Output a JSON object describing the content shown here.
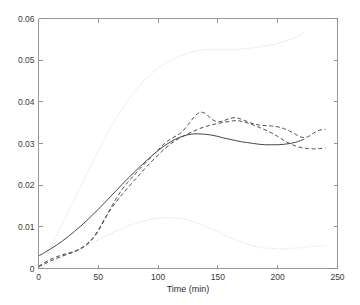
{
  "chart_data": {
    "type": "line",
    "title": "",
    "subtitle": "",
    "xlabel": "Time (min)",
    "ylabel": "",
    "xlim": [
      0,
      250
    ],
    "ylim": [
      0,
      0.06
    ],
    "xticks": [
      0,
      50,
      100,
      150,
      200,
      250
    ],
    "yticks": [
      0,
      0.01,
      0.02,
      0.03,
      0.04,
      0.05,
      0.06
    ],
    "xtick_labels": [
      "0",
      "50",
      "100",
      "150",
      "200",
      "250"
    ],
    "ytick_labels": [
      "0",
      "0.01",
      "0.02",
      "0.03",
      "0.04",
      "0.05",
      "0.06"
    ],
    "grid": false,
    "legend": null,
    "legend_position": "none",
    "annotations": [],
    "colors": {
      "solid": "#474747",
      "dashed": "#4e4e4e",
      "dotted": "#dedede",
      "axis": "#8c8c8c",
      "background": "#ffffff",
      "text": "#3a3a3a"
    },
    "series": [
      {
        "name": "mean-estimate",
        "style": "solid",
        "color": "#474747",
        "x": [
          0,
          5,
          10,
          15,
          20,
          25,
          30,
          35,
          40,
          45,
          50,
          55,
          60,
          65,
          70,
          75,
          80,
          85,
          90,
          95,
          100,
          105,
          110,
          115,
          120,
          125,
          130,
          135,
          140,
          145,
          150,
          155,
          160,
          165,
          170,
          175,
          180,
          185,
          190,
          195,
          200,
          205,
          210,
          215,
          220,
          222
        ],
        "y": [
          0.003,
          0.0038,
          0.0047,
          0.0056,
          0.0066,
          0.0077,
          0.0089,
          0.0101,
          0.0114,
          0.0128,
          0.0142,
          0.0157,
          0.0172,
          0.0187,
          0.0202,
          0.0217,
          0.0231,
          0.0245,
          0.0258,
          0.0271,
          0.0283,
          0.0294,
          0.0303,
          0.0311,
          0.0317,
          0.0321,
          0.0323,
          0.0323,
          0.0322,
          0.032,
          0.0317,
          0.0313,
          0.031,
          0.0307,
          0.0304,
          0.0302,
          0.03,
          0.0298,
          0.0297,
          0.0297,
          0.0297,
          0.0298,
          0.03,
          0.0303,
          0.0308,
          0.031
        ]
      },
      {
        "name": "replicate-upper-dashed",
        "style": "dashed",
        "color": "#4e4e4e",
        "x": [
          0,
          5,
          10,
          15,
          20,
          25,
          30,
          35,
          40,
          45,
          50,
          55,
          60,
          65,
          70,
          75,
          80,
          85,
          90,
          95,
          100,
          105,
          110,
          115,
          120,
          125,
          130,
          135,
          140,
          145,
          150,
          155,
          160,
          165,
          170,
          175,
          180,
          185,
          190,
          195,
          200,
          205,
          210,
          215,
          220,
          225,
          230,
          235,
          240
        ],
        "y": [
          0.0004,
          0.0011,
          0.0018,
          0.0024,
          0.003,
          0.0035,
          0.004,
          0.0047,
          0.0056,
          0.007,
          0.009,
          0.0116,
          0.0143,
          0.0168,
          0.019,
          0.0208,
          0.0224,
          0.024,
          0.0255,
          0.027,
          0.0285,
          0.0299,
          0.031,
          0.0318,
          0.0328,
          0.0345,
          0.0363,
          0.0375,
          0.0371,
          0.0358,
          0.0352,
          0.0355,
          0.036,
          0.0362,
          0.0358,
          0.0352,
          0.0347,
          0.0344,
          0.0343,
          0.0342,
          0.034,
          0.0336,
          0.033,
          0.0322,
          0.0315,
          0.0316,
          0.0325,
          0.0332,
          0.0334
        ]
      },
      {
        "name": "replicate-lower-dashed",
        "style": "dashed",
        "color": "#4e4e4e",
        "x": [
          0,
          5,
          10,
          15,
          20,
          25,
          30,
          35,
          40,
          45,
          50,
          55,
          60,
          65,
          70,
          75,
          80,
          85,
          90,
          95,
          100,
          105,
          110,
          115,
          120,
          125,
          130,
          135,
          140,
          145,
          150,
          155,
          160,
          165,
          170,
          175,
          180,
          185,
          190,
          195,
          200,
          205,
          210,
          215,
          220,
          225,
          230,
          235,
          240
        ],
        "y": [
          0.0005,
          0.0014,
          0.0022,
          0.0028,
          0.0033,
          0.0037,
          0.0041,
          0.0048,
          0.0058,
          0.0072,
          0.0092,
          0.0118,
          0.014,
          0.016,
          0.0178,
          0.0195,
          0.0211,
          0.0227,
          0.0243,
          0.0258,
          0.0272,
          0.0286,
          0.0298,
          0.0308,
          0.0316,
          0.0323,
          0.033,
          0.0336,
          0.0341,
          0.0345,
          0.0348,
          0.0351,
          0.0353,
          0.0355,
          0.0353,
          0.0349,
          0.0344,
          0.0338,
          0.0332,
          0.0325,
          0.0317,
          0.0308,
          0.03,
          0.0294,
          0.029,
          0.0288,
          0.0287,
          0.0288,
          0.0289
        ]
      },
      {
        "name": "confidence-upper-envelope",
        "style": "dotted",
        "color": "#dedede",
        "x": [
          0,
          5,
          10,
          15,
          20,
          25,
          30,
          35,
          40,
          45,
          50,
          55,
          60,
          65,
          70,
          75,
          80,
          85,
          90,
          95,
          100,
          105,
          110,
          115,
          120,
          125,
          130,
          135,
          140,
          145,
          150,
          155,
          160,
          165,
          170,
          175,
          180,
          185,
          190,
          195,
          200,
          205,
          210,
          215,
          220,
          222
        ],
        "y": [
          0.0,
          0.0025,
          0.0052,
          0.008,
          0.0108,
          0.0137,
          0.0166,
          0.0196,
          0.0225,
          0.0254,
          0.0282,
          0.031,
          0.0336,
          0.036,
          0.0383,
          0.0404,
          0.0423,
          0.044,
          0.0456,
          0.0469,
          0.0481,
          0.0491,
          0.0499,
          0.0506,
          0.0512,
          0.0517,
          0.0521,
          0.0523,
          0.0525,
          0.0526,
          0.0526,
          0.0526,
          0.0526,
          0.0526,
          0.0527,
          0.0528,
          0.053,
          0.0532,
          0.0534,
          0.0537,
          0.054,
          0.0544,
          0.0549,
          0.0555,
          0.0563,
          0.0567
        ]
      },
      {
        "name": "confidence-lower-envelope",
        "style": "dotted",
        "color": "#dedede",
        "x": [
          0,
          5,
          10,
          15,
          20,
          25,
          30,
          35,
          40,
          45,
          50,
          55,
          60,
          65,
          70,
          75,
          80,
          85,
          90,
          95,
          100,
          105,
          110,
          115,
          120,
          125,
          130,
          135,
          140,
          145,
          150,
          155,
          160,
          165,
          170,
          175,
          180,
          185,
          190,
          195,
          200,
          205,
          210,
          215,
          220,
          225,
          230,
          235,
          240
        ],
        "y": [
          0.0,
          0.0006,
          0.0013,
          0.002,
          0.0027,
          0.0034,
          0.0041,
          0.0048,
          0.0055,
          0.0062,
          0.0069,
          0.0076,
          0.0083,
          0.009,
          0.0096,
          0.0102,
          0.0107,
          0.0112,
          0.0116,
          0.0119,
          0.0121,
          0.0122,
          0.0122,
          0.0121,
          0.0119,
          0.0116,
          0.0112,
          0.0107,
          0.0101,
          0.0095,
          0.0088,
          0.0081,
          0.0075,
          0.0069,
          0.0063,
          0.0058,
          0.0054,
          0.0051,
          0.0049,
          0.0048,
          0.0047,
          0.0047,
          0.0048,
          0.0049,
          0.005,
          0.0052,
          0.0053,
          0.0054,
          0.0054
        ]
      }
    ]
  }
}
